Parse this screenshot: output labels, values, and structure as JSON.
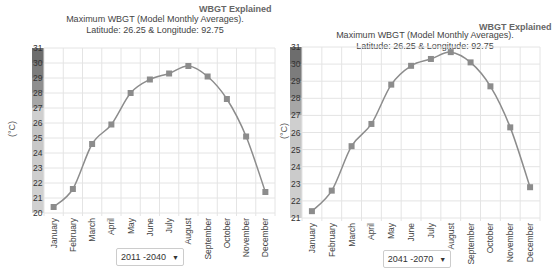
{
  "explained_link": "WBGT Explained",
  "title_line1": "Maximum WBGT (Model Monthly Averages).",
  "title_line2": "Latitude: 26.25 & Longitude: 92.75",
  "y_unit": "(°C)",
  "months": [
    "January",
    "February",
    "March",
    "April",
    "May",
    "June",
    "July",
    "August",
    "September",
    "October",
    "November",
    "December"
  ],
  "charts": [
    {
      "period": "2011 -2040"
    },
    {
      "period": "2041 -2070"
    }
  ],
  "colors": {
    "line": "#8c8c8c",
    "marker": "#8c8c8c",
    "grid": "#e4e4e4"
  },
  "chart_data": [
    {
      "type": "line",
      "title": "Maximum WBGT (Model Monthly Averages). Latitude: 26.25 & Longitude: 92.75",
      "subtitle": "2011 -2040",
      "xlabel": "",
      "ylabel": "(°C)",
      "categories": [
        "January",
        "February",
        "March",
        "April",
        "May",
        "June",
        "July",
        "August",
        "September",
        "October",
        "November",
        "December"
      ],
      "values": [
        20.4,
        21.6,
        24.6,
        25.9,
        28.0,
        28.9,
        29.3,
        29.8,
        29.1,
        27.6,
        25.1,
        21.4
      ],
      "ylim": [
        20,
        31
      ],
      "yticks": [
        20,
        21,
        22,
        23,
        24,
        25,
        26,
        27,
        28,
        29,
        30,
        31
      ],
      "grid": true
    },
    {
      "type": "line",
      "title": "Maximum WBGT (Model Monthly Averages). Latitude: 26.25 & Longitude: 92.75",
      "subtitle": "2041 -2070",
      "xlabel": "",
      "ylabel": "(°C)",
      "categories": [
        "January",
        "February",
        "March",
        "April",
        "May",
        "June",
        "July",
        "August",
        "September",
        "October",
        "November",
        "December"
      ],
      "values": [
        21.4,
        22.6,
        25.2,
        26.5,
        28.8,
        29.9,
        30.3,
        30.7,
        30.1,
        28.7,
        26.3,
        22.8
      ],
      "ylim": [
        21,
        31
      ],
      "yticks": [
        21,
        22,
        23,
        24,
        25,
        26,
        27,
        28,
        29,
        30,
        31
      ],
      "grid": true
    }
  ]
}
